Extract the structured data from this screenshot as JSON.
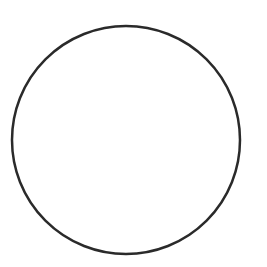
{
  "canvas": {
    "width": 267,
    "height": 267,
    "background_color": "#ffffff"
  },
  "figure": {
    "kind": "geometric-shape",
    "shape": "circle",
    "has_text": false,
    "has_fill": false
  },
  "shapes": [
    {
      "name": "circle-outline",
      "type": "circle",
      "center_x": 126,
      "center_y": 140,
      "radius": 114,
      "stroke_color": "#2b2b2b",
      "stroke_width": 2.5,
      "fill": "none",
      "bounds": {
        "left": 12,
        "top": 28,
        "right": 240,
        "bottom": 251
      }
    }
  ],
  "labels": {
    "title": "",
    "caption": "",
    "annotations": []
  }
}
